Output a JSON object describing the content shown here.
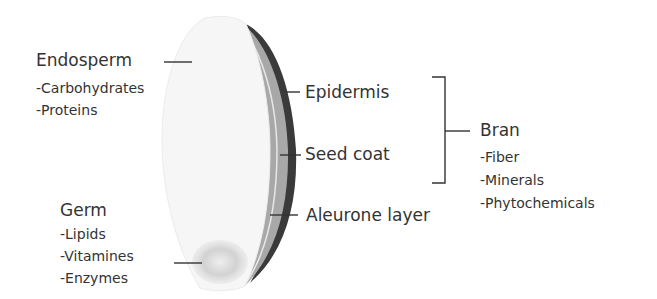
{
  "endosperm": {
    "title": "Endosperm",
    "items": [
      "-Carbohydrates",
      "-Proteins"
    ]
  },
  "germ": {
    "title": "Germ",
    "items": [
      "-Lipids",
      "-Vitamines",
      "-Enzymes"
    ]
  },
  "layers": {
    "epidermis": "Epidermis",
    "seed_coat": "Seed coat",
    "aleurone": "Aleurone layer"
  },
  "bran": {
    "title": "Bran",
    "items": [
      "-Fiber",
      "-Minerals",
      "-Phytochemicals"
    ]
  },
  "colors": {
    "epidermis": "#3a3a3a",
    "seed_coat": "#a8a8a8",
    "endosperm": "#f6f6f6",
    "germ": "#cfcfcf",
    "lines": "#333333"
  }
}
